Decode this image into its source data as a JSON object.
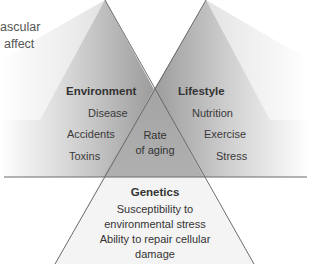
{
  "fragment_text": {
    "line1": "ascular",
    "line2": "affect"
  },
  "diagram": {
    "environment": {
      "heading": "Environment",
      "items": [
        "Disease",
        "Accidents",
        "Toxins"
      ]
    },
    "lifestyle": {
      "heading": "Lifestyle",
      "items": [
        "Nutrition",
        "Exercise",
        "Stress"
      ]
    },
    "center": {
      "line1": "Rate",
      "line2": "of aging"
    },
    "genetics": {
      "heading": "Genetics",
      "lines": [
        "Susceptibility to",
        "environmental stress",
        "Ability to repair cellular",
        "damage"
      ]
    }
  },
  "colors": {
    "line": "#6a6a6a",
    "center_fill": "#a9a9a9",
    "gradient_dark": "#9a9a9a",
    "gradient_light": "#ffffff",
    "genetics_fill": "#f3f3f3"
  }
}
